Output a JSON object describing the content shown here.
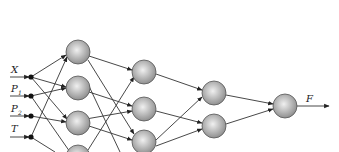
{
  "diagram": {
    "type": "feedforward-neural-network",
    "inputs": [
      {
        "label": "X",
        "sub": ""
      },
      {
        "label": "P",
        "sub": "1"
      },
      {
        "label": "P",
        "sub": "2"
      },
      {
        "label": "T",
        "sub": ""
      }
    ],
    "output": {
      "label": "F"
    },
    "layers": [
      {
        "name": "hidden-1",
        "nodes": 4
      },
      {
        "name": "hidden-2",
        "nodes": 3
      },
      {
        "name": "hidden-3",
        "nodes": 2
      },
      {
        "name": "output",
        "nodes": 1
      }
    ],
    "colors": {
      "node_fill_center": "#e8e8e8",
      "node_fill_edge": "#8c8c8c",
      "node_stroke": "#555555",
      "edge": "#333333"
    }
  }
}
